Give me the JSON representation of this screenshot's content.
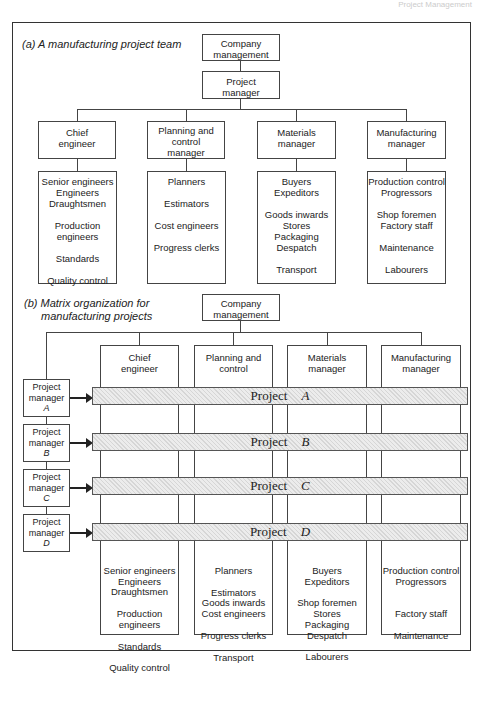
{
  "page_header": "Project Management",
  "part_a": {
    "caption": "(a) A manufacturing project team",
    "top": "Company management",
    "pm": "Project manager",
    "departments": [
      {
        "title": "Chief engineer",
        "staff": [
          "Senior engineers",
          "Engineers",
          "Draughtsmen",
          "",
          "Production",
          "engineers",
          "",
          "Standards",
          "",
          "Quality control"
        ]
      },
      {
        "title": "Planning and control manager",
        "staff": [
          "Planners",
          "",
          "Estimators",
          "",
          "Cost engineers",
          "",
          "Progress clerks"
        ]
      },
      {
        "title": "Materials manager",
        "staff": [
          "Buyers",
          "Expeditors",
          "",
          "Goods inwards",
          "Stores",
          "Packaging",
          "Despatch",
          "",
          "Transport"
        ]
      },
      {
        "title": "Manufacturing manager",
        "staff": [
          "Production control",
          "Progressors",
          "",
          "Shop foremen",
          "Factory staff",
          "",
          "Maintenance",
          "",
          "Labourers"
        ]
      }
    ]
  },
  "part_b": {
    "caption_line1": "(b)  Matrix organization for",
    "caption_line2": "manufacturing projects",
    "top": "Company management",
    "departments": [
      {
        "title": "Chief engineer",
        "staff": [
          "Senior engineers",
          "Engineers",
          "Draughtsmen",
          "",
          "Production",
          "engineers",
          "",
          "Standards",
          "",
          "Quality control"
        ]
      },
      {
        "title": "Planning and control",
        "staff": [
          "Planners",
          "",
          "Estimators",
          "Goods inwards",
          "Cost engineers",
          "",
          "Progress clerks",
          "",
          "Transport"
        ]
      },
      {
        "title": "Materials manager",
        "staff": [
          "Buyers",
          "Expeditors",
          "",
          "Shop foremen",
          "Stores",
          "Packaging",
          "Despatch",
          "",
          "Labourers"
        ]
      },
      {
        "title": "Manufacturing manager",
        "staff": [
          "Production control",
          "Progressors",
          "",
          "",
          "Factory staff",
          "",
          "Maintenance"
        ]
      }
    ],
    "project_managers": [
      {
        "label": "Project manager",
        "id": "A"
      },
      {
        "label": "Project manager",
        "id": "B"
      },
      {
        "label": "Project manager",
        "id": "C"
      },
      {
        "label": "Project manager",
        "id": "D"
      }
    ],
    "projects": [
      {
        "word": "Project",
        "id": "A"
      },
      {
        "word": "Project",
        "id": "B"
      },
      {
        "word": "Project",
        "id": "C"
      },
      {
        "word": "Project",
        "id": "D"
      }
    ]
  }
}
